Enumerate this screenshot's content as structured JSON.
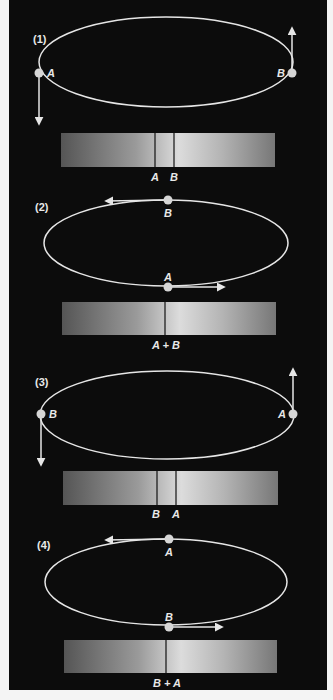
{
  "colors": {
    "background": "#0c0c0c",
    "page": "#f4f4f4",
    "orbit": "#e6e6e6",
    "star": "#d6d6d6",
    "spectrum_dark": "#555555",
    "spectrum_light": "#e0e0e0",
    "spectral_line": "#111111"
  },
  "panels": [
    {
      "id": "1",
      "label": "(1)",
      "stars": [
        {
          "name": "A",
          "position": "left",
          "velocity": "down"
        },
        {
          "name": "B",
          "position": "right",
          "velocity": "up"
        }
      ],
      "spectrum_lines": [
        "A",
        "B"
      ],
      "line_labels": [
        "A",
        "B"
      ]
    },
    {
      "id": "2",
      "label": "(2)",
      "stars": [
        {
          "name": "B",
          "position": "top",
          "velocity": "left"
        },
        {
          "name": "A",
          "position": "bottom",
          "velocity": "right"
        }
      ],
      "spectrum_lines": [
        "A + B"
      ],
      "line_labels": [
        "A + B"
      ]
    },
    {
      "id": "3",
      "label": "(3)",
      "stars": [
        {
          "name": "B",
          "position": "left",
          "velocity": "down"
        },
        {
          "name": "A",
          "position": "right",
          "velocity": "up"
        }
      ],
      "spectrum_lines": [
        "B",
        "A"
      ],
      "line_labels": [
        "B",
        "A"
      ]
    },
    {
      "id": "4",
      "label": "(4)",
      "stars": [
        {
          "name": "A",
          "position": "top",
          "velocity": "left"
        },
        {
          "name": "B",
          "position": "bottom",
          "velocity": "right"
        }
      ],
      "spectrum_lines": [
        "B + A"
      ],
      "line_labels": [
        "B + A"
      ]
    }
  ]
}
